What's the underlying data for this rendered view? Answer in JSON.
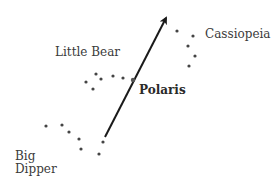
{
  "diagram": {
    "labels": {
      "cassiopeia": "Cassiopeia",
      "little_bear": "Little Bear",
      "polaris": "Polaris",
      "big_dipper_line1": "Big",
      "big_dipper_line2": "Dipper"
    },
    "colors": {
      "star": "#444444",
      "arrow": "#1a1a1a",
      "text": "#3a3a3a"
    },
    "constellations": {
      "cassiopeia": [
        [
          177,
          31
        ],
        [
          193,
          36
        ],
        [
          188,
          46
        ],
        [
          195,
          56
        ],
        [
          189,
          66
        ]
      ],
      "little_bear": [
        [
          86,
          82
        ],
        [
          96,
          74
        ],
        [
          101,
          79
        ],
        [
          113,
          76
        ],
        [
          123,
          78
        ],
        [
          93,
          89
        ]
      ],
      "big_dipper": [
        [
          46,
          126
        ],
        [
          62,
          125
        ],
        [
          69,
          132
        ],
        [
          79,
          139
        ],
        [
          81,
          149
        ],
        [
          103,
          142
        ],
        [
          99,
          154
        ]
      ]
    },
    "polaris": [
      133,
      80
    ],
    "arrow": {
      "from": [
        105,
        137
      ],
      "to": [
        168,
        14
      ]
    }
  }
}
